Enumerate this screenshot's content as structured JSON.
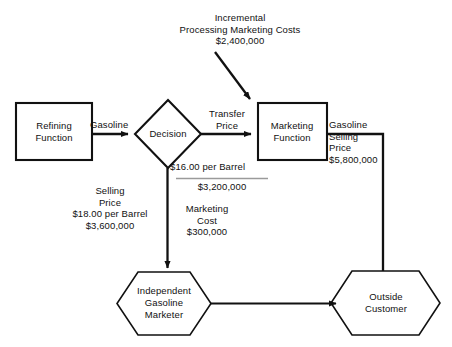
{
  "diagram": {
    "nodes": {
      "refining": {
        "line1": "Refining",
        "line2": "Function",
        "shape": "rectangle"
      },
      "decision": {
        "line1": "Decision",
        "shape": "diamond"
      },
      "marketing": {
        "line1": "Marketing",
        "line2": "Function",
        "shape": "rectangle"
      },
      "independent_marketer": {
        "line1": "Independent",
        "line2": "Gasoline",
        "line3": "Marketer",
        "shape": "hexagon"
      },
      "outside_customer": {
        "line1": "Outside",
        "line2": "Customer",
        "shape": "hexagon"
      }
    },
    "labels": {
      "incremental_costs": {
        "line1": "Incremental",
        "line2": "Processing Marketing Costs",
        "line3": "$2,400,000"
      },
      "gasoline_left": "Gasoline",
      "transfer_price": {
        "line1": "Transfer",
        "line2": "Price"
      },
      "gasoline_right": {
        "line1": "Gasoline",
        "line2": "Selling",
        "line3": "Price",
        "line4": "$5,800,000"
      },
      "transfer_math": {
        "line1": "$16.00 per Barrel",
        "line2": "$3,200,000"
      },
      "marketing_cost": {
        "line1": "Marketing",
        "line2": "Cost",
        "line3": "$300,000"
      },
      "selling_price_left": {
        "line1": "Selling",
        "line2": "Price",
        "line3": "$18.00 per Barrel",
        "line4": "$3,600,000"
      }
    },
    "colors": {
      "stroke": "#111111",
      "rule": "#9a9a9a",
      "background": "#ffffff",
      "text": "#111111"
    }
  }
}
